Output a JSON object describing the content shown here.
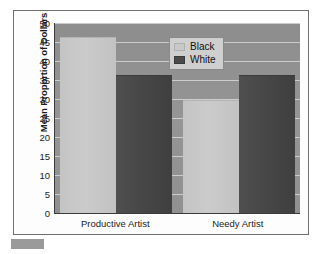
{
  "chart_data": {
    "type": "bar",
    "title": "",
    "xlabel": "",
    "ylabel": "Mean Proportion of Dollars",
    "ylim": [
      0,
      50
    ],
    "yticks": [
      0,
      5,
      10,
      15,
      20,
      25,
      30,
      35,
      40,
      45,
      50
    ],
    "ytick_labels": [
      "0",
      "5",
      "10",
      "15",
      "20",
      "25",
      "30",
      "35",
      "40",
      "45",
      "50"
    ],
    "grid": true,
    "categories": [
      "Productive Artist",
      "Needy Artist"
    ],
    "legend_position": "upper center",
    "series": [
      {
        "name": "Black",
        "color": "#c9c9c9",
        "values": [
          46,
          29.5
        ]
      },
      {
        "name": "White",
        "color": "#4a4a4a",
        "values": [
          36,
          36
        ]
      }
    ]
  },
  "figure": {
    "plot_background_color": "#919191",
    "frame_border_color": "#6f6f6f",
    "gridline_color": "#d7d7d7",
    "axis_color": "#3b3b3b",
    "page_background_color": "#ffffff"
  },
  "legend": {
    "entries": [
      {
        "label": "Black",
        "swatch": "legend-swatch-black"
      },
      {
        "label": "White",
        "swatch": "legend-swatch-white"
      }
    ]
  }
}
